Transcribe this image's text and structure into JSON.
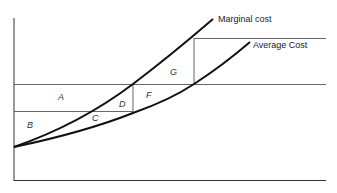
{
  "diagram": {
    "curves": [
      {
        "name": "marginal-cost",
        "label": "Marginal cost"
      },
      {
        "name": "average-cost",
        "label": "Average Cost"
      }
    ],
    "regions": [
      {
        "id": "A",
        "label": "A"
      },
      {
        "id": "B",
        "label": "B"
      },
      {
        "id": "C",
        "label": "C"
      },
      {
        "id": "D",
        "label": "D"
      },
      {
        "id": "F",
        "label": "F"
      },
      {
        "id": "G",
        "label": "G"
      }
    ],
    "colors": {
      "curve": "#111111",
      "guide": "#555555",
      "axis": "#333333"
    }
  }
}
